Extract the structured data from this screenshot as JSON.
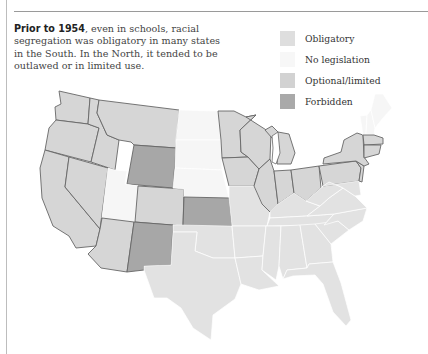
{
  "caption": {
    "lead": "Prior to 1954",
    "body": ", even in schools, racial segregation was obligatory in many states in the South. In the North, it tended to be outlawed or in limited use."
  },
  "legend": [
    {
      "key": "obligatory",
      "label": "Obligatory",
      "color": "#dedede"
    },
    {
      "key": "none",
      "label": "No legislation",
      "color": "#f7f7f7"
    },
    {
      "key": "optional",
      "label": "Optional/limited",
      "color": "#d2d2d2"
    },
    {
      "key": "forbidden",
      "label": "Forbidden",
      "color": "#a9a9a9"
    }
  ],
  "colors": {
    "obligatory": "#e2e2e2",
    "none": "#f6f6f6",
    "optional": "#d6d6d6",
    "forbidden": "#a7a7a7"
  },
  "states": [
    {
      "name": "Washington",
      "status": "optional",
      "pts": "70,33 101,40 99,66 67,62 66,49 72,46"
    },
    {
      "name": "Oregon",
      "status": "optional",
      "pts": "67,62 99,66 110,70 102,104 56,92 60,70"
    },
    {
      "name": "California",
      "status": "optional",
      "pts": "56,92 80,99 76,129 111,171 107,188 87,190 80,178 64,168 53,140 51,110"
    },
    {
      "name": "Nevada",
      "status": "optional",
      "pts": "80,99 119,110 111,171 76,129"
    },
    {
      "name": "Idaho",
      "status": "optional",
      "pts": "101,40 110,42 108,55 118,77 130,82 126,112 102,104 110,70 99,66"
    },
    {
      "name": "Montana",
      "status": "optional",
      "pts": "110,42 190,52 187,90 145,87 142,84 130,82 118,77 108,55"
    },
    {
      "name": "Wyoming",
      "status": "forbidden",
      "pts": "145,87 187,90 184,130 138,126"
    },
    {
      "name": "Utah",
      "status": "none",
      "pts": "119,110 126,112 138,113 136,126 149,128 146,164 113,160"
    },
    {
      "name": "Colorado",
      "status": "optional",
      "pts": "149,128 195,131 194,168 146,164"
    },
    {
      "name": "Arizona",
      "status": "optional",
      "pts": "113,160 145,164 138,214 112,210 99,196 107,188 111,171"
    },
    {
      "name": "New Mexico",
      "status": "forbidden",
      "pts": "145,164 184,167 182,207 155,208 155,212 138,214"
    },
    {
      "name": "North Dakota",
      "status": "none",
      "pts": "190,52 229,53 232,82 187,82"
    },
    {
      "name": "South Dakota",
      "status": "none",
      "pts": "187,82 232,82 233,112 186,110"
    },
    {
      "name": "Nebraska",
      "status": "none",
      "pts": "186,110 233,112 240,140 195,139 195,131 184,130"
    },
    {
      "name": "Kansas",
      "status": "forbidden",
      "pts": "195,139 240,140 243,168 194,168"
    },
    {
      "name": "Oklahoma",
      "status": "obligatory",
      "pts": "184,167 243,168 246,200 224,200 206,193 208,174 184,174"
    },
    {
      "name": "Texas",
      "status": "obligatory",
      "pts": "184,174 208,174 206,193 224,200 246,200 252,226 246,241 224,257 222,282 204,270 192,250 178,240 165,240 155,212 155,208 182,207"
    },
    {
      "name": "Minnesota",
      "status": "optional",
      "pts": "229,53 245,53 257,59 267,57 251,72 252,94 259,99 233,100 232,82"
    },
    {
      "name": "Iowa",
      "status": "optional",
      "pts": "233,100 259,99 270,111 265,128 240,128"
    },
    {
      "name": "Missouri",
      "status": "obligatory",
      "pts": "240,128 265,128 273,146 281,154 278,168 243,168 240,140"
    },
    {
      "name": "Arkansas",
      "status": "obligatory",
      "pts": "243,168 277,168 274,198 246,200"
    },
    {
      "name": "Louisiana",
      "status": "obligatory",
      "pts": "246,200 274,198 273,212 290,228 270,232 252,226"
    },
    {
      "name": "Wisconsin",
      "status": "optional",
      "pts": "257,59 271,68 282,75 281,101 270,111 259,99 252,94 251,72 267,57"
    },
    {
      "name": "Illinois",
      "status": "optional",
      "pts": "265,128 270,111 281,101 285,113 289,146 281,154 273,146"
    },
    {
      "name": "Michigan",
      "status": "optional",
      "pts": "289,74 300,76 306,95 302,106 288,106 290,88 276,72 283,68"
    },
    {
      "name": "Indiana",
      "status": "optional",
      "pts": "285,113 302,112 305,135 289,146"
    },
    {
      "name": "Ohio",
      "status": "optional",
      "pts": "302,112 330,108 332,130 317,143 305,135"
    },
    {
      "name": "Kentucky",
      "status": "obligatory",
      "pts": "281,154 289,146 305,135 317,143 331,148 318,158 281,160"
    },
    {
      "name": "Tennessee",
      "status": "obligatory",
      "pts": "278,168 281,160 318,158 345,156 335,167"
    },
    {
      "name": "Mississippi",
      "status": "obligatory",
      "pts": "277,168 292,168 290,208 287,222 273,212 274,198"
    },
    {
      "name": "Alabama",
      "status": "obligatory",
      "pts": "292,168 311,167 318,210 298,212 294,221 290,208"
    },
    {
      "name": "Georgia",
      "status": "obligatory",
      "pts": "311,167 326,166 342,186 344,204 320,206 318,210"
    },
    {
      "name": "Florida",
      "status": "obligatory",
      "pts": "294,221 298,212 318,210 320,206 344,204 352,225 362,262 357,268 344,254 334,226 326,217 304,218"
    },
    {
      "name": "South Carolina",
      "status": "obligatory",
      "pts": "326,166 349,163 360,172 342,186"
    },
    {
      "name": "North Carolina",
      "status": "obligatory",
      "pts": "335,167 345,156 378,150 374,163 360,172 349,163"
    },
    {
      "name": "Virginia",
      "status": "obligatory",
      "pts": "318,158 331,148 340,140 354,130 366,138 378,150 345,156"
    },
    {
      "name": "West Virginia",
      "status": "obligatory",
      "pts": "332,130 340,124 350,128 354,130 340,140 331,148 317,143"
    },
    {
      "name": "Pennsylvania",
      "status": "optional",
      "pts": "330,108 367,103 372,110 370,123 334,128"
    },
    {
      "name": "Maryland/Delaware",
      "status": "obligatory",
      "pts": "334,128 370,123 372,137 366,138 354,130 350,128 340,124"
    },
    {
      "name": "New Jersey",
      "status": "optional",
      "pts": "367,103 375,108 373,124 370,123 372,110"
    },
    {
      "name": "New York",
      "status": "optional",
      "pts": "335,100 352,94 355,82 368,75 374,77 375,99 380,106 375,108 367,103 334,106"
    },
    {
      "name": "Vermont",
      "status": "none",
      "pts": "371,58 378,57 377,76 374,77"
    },
    {
      "name": "New Hampshire",
      "status": "none",
      "pts": "378,57 382,52 386,70 385,77 377,76"
    },
    {
      "name": "Maine",
      "status": "none",
      "pts": "382,52 386,36 394,36 403,50 394,60 386,70"
    },
    {
      "name": "Massachusetts",
      "status": "optional",
      "pts": "374,77 385,77 394,80 394,86 375,87"
    },
    {
      "name": "Connecticut/RI",
      "status": "optional",
      "pts": "375,87 392,87 390,96 375,100"
    }
  ],
  "lakes": [
    {
      "name": "Lake Michigan",
      "pts": "283,78 289,74 291,95 287,106 283,104 284,90"
    }
  ]
}
